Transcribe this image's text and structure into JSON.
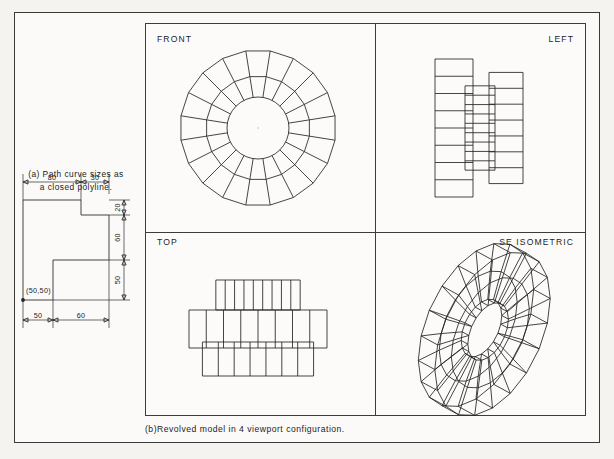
{
  "figure": {
    "part_a": {
      "caption_line1": "(a) Path curve sizes as",
      "caption_line2": "a closed polyline.",
      "origin_label": "(50,50)",
      "dimensions": {
        "top": [
          "80",
          "30"
        ],
        "right": [
          "20",
          "60",
          "50"
        ],
        "bottom": [
          "50",
          "60"
        ]
      }
    },
    "part_b": {
      "caption": "(b)Revolved model in 4 viewport configuration.",
      "viewports": [
        {
          "id": "front",
          "label": "FRONT"
        },
        {
          "id": "left",
          "label": "LEFT"
        },
        {
          "id": "top",
          "label": "TOP"
        },
        {
          "id": "se",
          "label": "SE ISOMETRIC"
        }
      ]
    }
  },
  "chart_data": {
    "type": "table",
    "title": "Revolved model in 4 viewport configuration",
    "profile_polyline": {
      "description": "Closed polyline path curve revolved 360 degrees",
      "start_point": [
        50,
        50
      ],
      "widths": [
        50,
        60
      ],
      "heights": [
        50,
        60,
        20
      ],
      "top_spans": [
        80,
        30
      ],
      "vertices": [
        [
          50,
          50
        ],
        [
          50,
          180
        ],
        [
          130,
          180
        ],
        [
          130,
          160
        ],
        [
          160,
          160
        ],
        [
          160,
          100
        ],
        [
          110,
          100
        ],
        [
          110,
          50
        ],
        [
          50,
          50
        ]
      ]
    },
    "front_view": {
      "segments": 20,
      "rings": 2,
      "hub_circle": true
    },
    "left_view": {
      "bands": 3,
      "divisions_per_band": [
        9,
        8,
        7
      ]
    },
    "top_view": {
      "bands": 3,
      "divisions_per_band": [
        9,
        8,
        7
      ]
    },
    "isometric_view": {
      "segments": 20,
      "rings": 2
    }
  },
  "colors": {
    "ink": "#242424",
    "paper": "#fbfaf8",
    "page_bg": "#f3f2ef",
    "border": "#3a3a3a"
  }
}
